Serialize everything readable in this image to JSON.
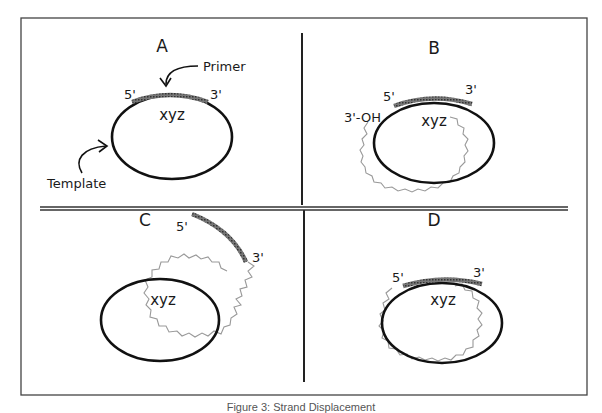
{
  "figure": {
    "caption": "Figure 3: Strand Displacement",
    "panels": [
      {
        "id": "A",
        "label": "A",
        "primer_5": "5'",
        "primer_3": "3'",
        "circle_label": "xyz",
        "primer_callout": "Primer",
        "template_callout": "Template"
      },
      {
        "id": "B",
        "label": "B",
        "primer_5": "5'",
        "primer_3": "3'",
        "circle_label": "xyz",
        "end_label": "3'-OH"
      },
      {
        "id": "C",
        "label": "C",
        "primer_5": "5'",
        "primer_3": "3'",
        "circle_label": "xyz"
      },
      {
        "id": "D",
        "label": "D",
        "primer_5": "5'",
        "primer_3": "3'",
        "circle_label": "xyz"
      }
    ]
  },
  "colors": {
    "frame": "#333333",
    "template_circle": "#111111",
    "primer": "#555555",
    "new_strand": "#9a9a9a"
  }
}
